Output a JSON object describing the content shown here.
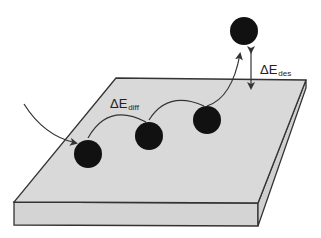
{
  "diagram": {
    "labels": {
      "diffusion": {
        "symbol": "ΔE",
        "subscript": "diff"
      },
      "desorption": {
        "symbol": "ΔE",
        "subscript": "des"
      }
    },
    "colors": {
      "surface_top": "#d9d9d9",
      "surface_side": "#d4d4d4",
      "outline": "#333333",
      "adatom": "#111111",
      "path": "#333333"
    },
    "adatoms": [
      {
        "id": "adatom-1",
        "cx": 88,
        "cy": 154,
        "r": 14
      },
      {
        "id": "adatom-2",
        "cx": 149,
        "cy": 136,
        "r": 14
      },
      {
        "id": "adatom-3",
        "cx": 207,
        "cy": 120,
        "r": 14
      },
      {
        "id": "adatom-desorbed",
        "cx": 244,
        "cy": 31,
        "r": 14
      }
    ]
  }
}
